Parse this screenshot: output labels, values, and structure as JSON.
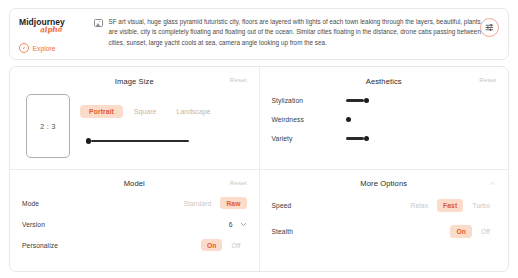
{
  "brand": {
    "name": "Midjourney",
    "script_subtitle": "alpha",
    "explore_label": "Explore",
    "explore_icon": "compass-icon",
    "logo_icon": "midjourney-logo"
  },
  "prompt_bar": {
    "image_icon": "image-icon",
    "text": "SF art visual, huge glass pyramid futuristic city, floors are layered with lights of each town leaking through the layers, beautiful, plants are visible, city is completely floating and floating out of the ocean. Similar cities floating in the distance, drone cabs passing between cities, sunset, large yacht cools at sea, camera angle looking up from the sea.",
    "settings_icon": "sliders-settings-icon"
  },
  "panels": {
    "image_size": {
      "title": "Image Size",
      "reset_label": "Reset",
      "aspect_ratio": "2 : 3",
      "segments": [
        {
          "label": "Portrait",
          "active": true
        },
        {
          "label": "Square",
          "active": false
        },
        {
          "label": "Landscape",
          "active": false
        }
      ],
      "slider": {
        "name": "image-size-slider",
        "fill_percent": 0,
        "track_width": 98
      }
    },
    "aesthetics": {
      "title": "Aesthetics",
      "reset_label": "Reset",
      "rows": [
        {
          "label": "Stylization",
          "name": "stylization-slider",
          "fill_width": 18
        },
        {
          "label": "Weirdness",
          "name": "weirdness-slider",
          "fill_width": 0
        },
        {
          "label": "Variety",
          "name": "variety-slider",
          "fill_width": 18
        }
      ]
    },
    "model": {
      "title": "Model",
      "reset_label": "Reset",
      "rows": [
        {
          "label": "Mode",
          "type": "pills",
          "options": [
            {
              "label": "Standard",
              "active": false
            },
            {
              "label": "Raw",
              "active": true
            }
          ]
        },
        {
          "label": "Version",
          "type": "select",
          "value": "6",
          "icon": "chevron-down-icon"
        },
        {
          "label": "Personalize",
          "type": "pills",
          "options": [
            {
              "label": "On",
              "active": true
            },
            {
              "label": "Off",
              "active": false
            }
          ]
        }
      ]
    },
    "more_options": {
      "title": "More Options",
      "collapse_icon": "chevron-up-icon",
      "rows": [
        {
          "label": "Speed",
          "type": "pills",
          "options": [
            {
              "label": "Relax",
              "active": false
            },
            {
              "label": "Fast",
              "active": true
            },
            {
              "label": "Turbo",
              "active": false
            }
          ]
        },
        {
          "label": "Stealth",
          "type": "pills",
          "options": [
            {
              "label": "On",
              "active": true
            },
            {
              "label": "Off",
              "active": false
            }
          ]
        }
      ]
    }
  },
  "colors": {
    "accent": "#e2592a",
    "accent_bg": "#fbdccb",
    "brand_script": "#f06b3e",
    "muted": "#c4c4c4",
    "slider": "#1d1d1d"
  }
}
